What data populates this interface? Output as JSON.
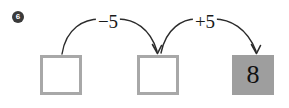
{
  "worksheet": {
    "problem_number": "6",
    "background_color": "#ffffff",
    "width": 289,
    "height": 108
  },
  "boxes": [
    {
      "name": "box-1",
      "value": "",
      "state": "empty",
      "fill_color": "#ffffff",
      "border_color": "#a8a8a8"
    },
    {
      "name": "box-2",
      "value": "",
      "state": "empty",
      "fill_color": "#ffffff",
      "border_color": "#a8a8a8"
    },
    {
      "name": "box-3",
      "value": "8",
      "state": "filled",
      "fill_color": "#9e9e9e",
      "border_color": "#9e9e9e",
      "text_color": "#111111"
    }
  ],
  "arrows": [
    {
      "name": "arrow-minus-five",
      "label": "−5",
      "operation": "subtract",
      "amount": 5,
      "from": "box-1",
      "to": "box-2",
      "stroke_color": "#2b2b2b"
    },
    {
      "name": "arrow-plus-five",
      "label": "+5",
      "operation": "add",
      "amount": 5,
      "from": "box-2",
      "to": "box-3",
      "stroke_color": "#2b2b2b"
    }
  ]
}
